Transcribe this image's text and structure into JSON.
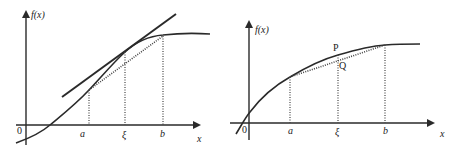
{
  "figures": [
    {
      "id": "left",
      "description": "Mean value theorem: tangent at xi parallel to chord from a to b",
      "y_axis_label": "f(x)",
      "x_axis_label": "x",
      "origin_label": "0",
      "tick_labels": [
        "a",
        "ξ",
        "b"
      ],
      "elements": [
        "curve f(x)",
        "tangent line at ξ",
        "dotted chord from (a,f(a)) to (b,f(b))",
        "dotted verticals at a, ξ, b"
      ]
    },
    {
      "id": "right",
      "description": "Concave curve with chord; point P on curve above point Q on chord at ξ",
      "y_axis_label": "f(x)",
      "x_axis_label": "x",
      "origin_label": "0",
      "tick_labels": [
        "a",
        "ξ",
        "b"
      ],
      "point_labels": [
        "P",
        "Q"
      ],
      "elements": [
        "curve f(x)",
        "dotted chord from (a,f(a)) to (b,f(b))",
        "dotted verticals at a, ξ, b"
      ]
    }
  ],
  "colors": {
    "line": "#2a2a2a",
    "background": "#ffffff"
  }
}
